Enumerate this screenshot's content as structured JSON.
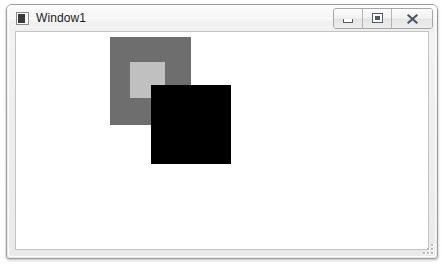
{
  "window": {
    "title": "Window1",
    "icon": "app-window-icon",
    "frame_color": "#9d9d9d",
    "titlebar_gradient_top": "#fdfdfd",
    "titlebar_gradient_bottom": "#ededed",
    "client_background": "#ffffff",
    "client_border": "#c3c3c3"
  },
  "caption_buttons": [
    {
      "name": "minimize-button",
      "icon": "minimize-icon",
      "tooltip": "Minimize"
    },
    {
      "name": "maximize-button",
      "icon": "maximize-icon",
      "tooltip": "Maximize"
    },
    {
      "name": "close-button",
      "icon": "close-icon",
      "tooltip": "Close"
    }
  ],
  "canvas": {
    "description": "Three overlapping filled rectangles drawn on a white canvas",
    "shapes": [
      {
        "name": "gray-rectangle",
        "order": 1,
        "fill": "#6e6e6e",
        "x": 94,
        "y": 5,
        "width": 81,
        "height": 88
      },
      {
        "name": "light-gray-rectangle",
        "order": 2,
        "fill": "#c0c0c0",
        "x": 114,
        "y": 30,
        "width": 35,
        "height": 36
      },
      {
        "name": "black-rectangle",
        "order": 3,
        "fill": "#000000",
        "x": 135,
        "y": 53,
        "width": 80,
        "height": 79
      }
    ]
  },
  "status": {
    "resize_grip": "resize-grip-icon"
  }
}
